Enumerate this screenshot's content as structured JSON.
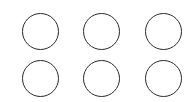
{
  "grid": {
    "rows": 2,
    "cols": 3,
    "stroke_color": "#2a2a2a",
    "fill_color": "#ffffff",
    "items": [
      {
        "shape": "circle-outline",
        "row": 1,
        "col": 1
      },
      {
        "shape": "circle-outline",
        "row": 1,
        "col": 2
      },
      {
        "shape": "circle-outline",
        "row": 1,
        "col": 3
      },
      {
        "shape": "circle-outline",
        "row": 2,
        "col": 1
      },
      {
        "shape": "circle-outline",
        "row": 2,
        "col": 2
      },
      {
        "shape": "circle-outline",
        "row": 2,
        "col": 3
      }
    ]
  }
}
